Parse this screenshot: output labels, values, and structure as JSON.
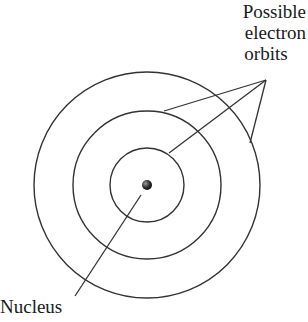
{
  "diagram": {
    "labels": {
      "orbits_line1": "Possible",
      "orbits_line2": "electron",
      "orbits_line3": "orbits",
      "nucleus": "Nucleus"
    },
    "center": [
      147,
      185
    ],
    "orbit_radii": [
      37,
      74,
      113
    ],
    "colors": {
      "stroke": "#333333",
      "nucleus": "#2a2a2a",
      "text": "#1a1a1a"
    }
  }
}
